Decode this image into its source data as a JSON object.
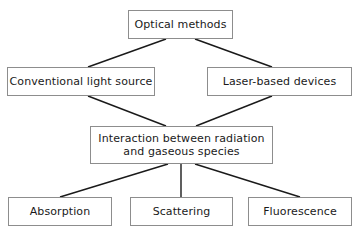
{
  "diagram": {
    "background_color": "#ffffff",
    "box_border_color": "#8d8d8d",
    "connector_color": "#1a1a1a",
    "text_color": "#1a1a1a",
    "nodes": [
      {
        "id": "optical-methods",
        "label": "Optical methods",
        "level": 0,
        "x": 128,
        "y": 10,
        "w": 105,
        "h": 29
      },
      {
        "id": "conventional-light-source",
        "label": "Conventional light source",
        "level": 1,
        "x": 7,
        "y": 67,
        "w": 148,
        "h": 29
      },
      {
        "id": "laser-based-devices",
        "label": "Laser-based devices",
        "level": 1,
        "x": 207,
        "y": 67,
        "w": 145,
        "h": 29
      },
      {
        "id": "interaction-radiation-gaseous-species",
        "label": "Interaction between radiation\nand gaseous species",
        "level": 2,
        "x": 90,
        "y": 126,
        "w": 183,
        "h": 38
      },
      {
        "id": "absorption",
        "label": "Absorption",
        "level": 3,
        "x": 8,
        "y": 197,
        "w": 104,
        "h": 29
      },
      {
        "id": "scattering",
        "label": "Scattering",
        "level": 3,
        "x": 130,
        "y": 197,
        "w": 103,
        "h": 29
      },
      {
        "id": "fluorescence",
        "label": "Fluorescence",
        "level": 3,
        "x": 248,
        "y": 197,
        "w": 104,
        "h": 29
      }
    ],
    "connectors": [
      {
        "id": "optical-to-conventional",
        "from": "optical-methods",
        "to": "conventional-light-source",
        "x1": 166,
        "y1": 39,
        "x2": 88,
        "y2": 67
      },
      {
        "id": "optical-to-laser",
        "from": "optical-methods",
        "to": "laser-based-devices",
        "x1": 195,
        "y1": 39,
        "x2": 272,
        "y2": 67
      },
      {
        "id": "conventional-to-interaction",
        "from": "conventional-light-source",
        "to": "interaction-radiation-gaseous-species",
        "x1": 88,
        "y1": 96,
        "x2": 166,
        "y2": 126
      },
      {
        "id": "laser-to-interaction",
        "from": "laser-based-devices",
        "to": "interaction-radiation-gaseous-species",
        "x1": 272,
        "y1": 96,
        "x2": 196,
        "y2": 126
      },
      {
        "id": "interaction-to-absorption",
        "from": "interaction-radiation-gaseous-species",
        "to": "absorption",
        "x1": 168,
        "y1": 164,
        "x2": 60,
        "y2": 197
      },
      {
        "id": "interaction-to-scattering",
        "from": "interaction-radiation-gaseous-species",
        "to": "scattering",
        "x1": 181,
        "y1": 164,
        "x2": 181,
        "y2": 197
      },
      {
        "id": "interaction-to-fluorescence",
        "from": "interaction-radiation-gaseous-species",
        "to": "fluorescence",
        "x1": 195,
        "y1": 164,
        "x2": 300,
        "y2": 197
      }
    ]
  }
}
